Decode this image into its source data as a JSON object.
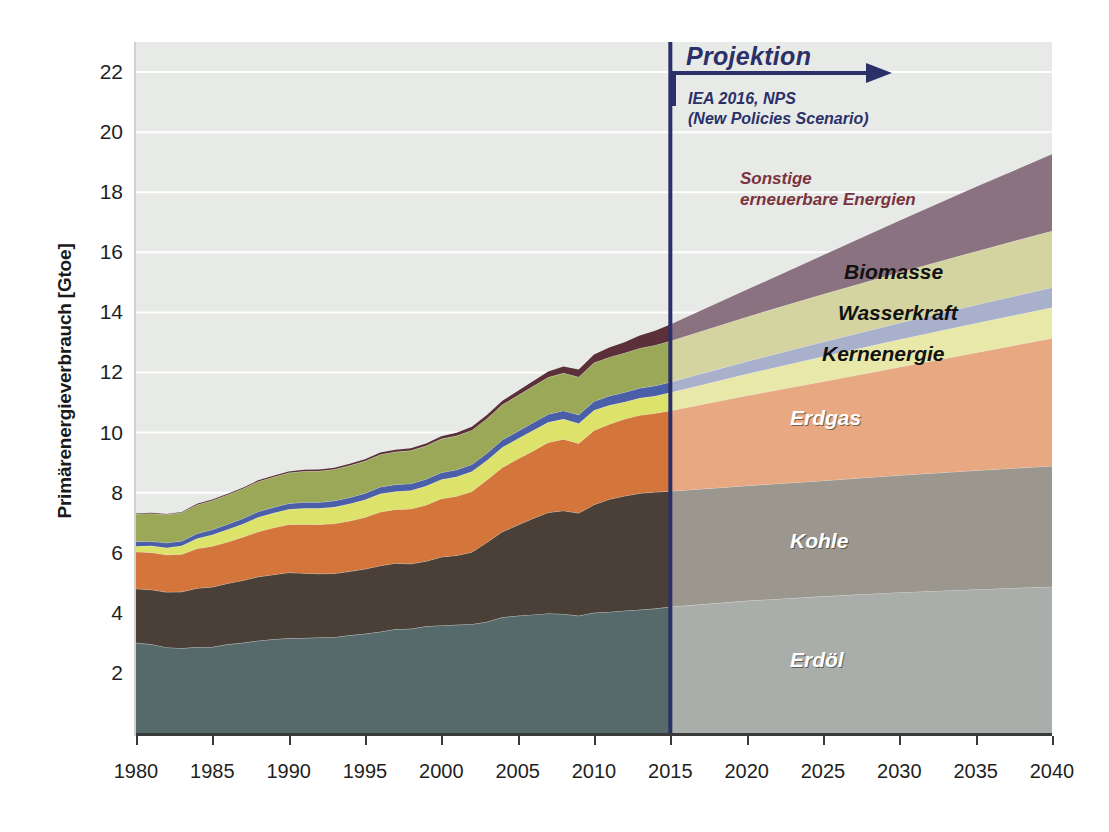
{
  "chart_data": {
    "type": "area",
    "title": "",
    "xlabel": "",
    "ylabel": "Primärenergieverbrauch [Gtoe]",
    "xlim": [
      1980,
      2040
    ],
    "ylim": [
      0,
      23
    ],
    "grid": true,
    "stacked": true,
    "legend_position": "in-plot-labels",
    "projection_start": 2015,
    "xticks": [
      "1980",
      "1985",
      "1990",
      "1995",
      "2000",
      "2005",
      "2010",
      "2015",
      "2020",
      "2025",
      "2030",
      "2035",
      "2040"
    ],
    "yticks": [
      "2",
      "4",
      "6",
      "8",
      "10",
      "12",
      "14",
      "16",
      "18",
      "20",
      "22"
    ],
    "x": [
      1980,
      1981,
      1982,
      1983,
      1984,
      1985,
      1986,
      1987,
      1988,
      1989,
      1990,
      1991,
      1992,
      1993,
      1994,
      1995,
      1996,
      1997,
      1998,
      1999,
      2000,
      2001,
      2002,
      2003,
      2004,
      2005,
      2006,
      2007,
      2008,
      2009,
      2010,
      2011,
      2012,
      2013,
      2014,
      2015,
      2020,
      2025,
      2030,
      2035,
      2040
    ],
    "series": [
      {
        "name": "Erdöl",
        "color_hist": "#56696b",
        "color_proj": "#a9aeab",
        "values": [
          3.0,
          2.95,
          2.85,
          2.82,
          2.86,
          2.86,
          2.95,
          3.0,
          3.07,
          3.12,
          3.15,
          3.16,
          3.18,
          3.19,
          3.25,
          3.3,
          3.37,
          3.45,
          3.47,
          3.55,
          3.58,
          3.6,
          3.62,
          3.7,
          3.85,
          3.9,
          3.94,
          3.98,
          3.96,
          3.9,
          4.0,
          4.03,
          4.07,
          4.1,
          4.14,
          4.2,
          4.4,
          4.55,
          4.68,
          4.78,
          4.87
        ]
      },
      {
        "name": "Kohle",
        "color_hist": "#4a4038",
        "color_proj": "#9b978e",
        "values": [
          1.8,
          1.82,
          1.84,
          1.88,
          1.96,
          2.0,
          2.03,
          2.08,
          2.13,
          2.15,
          2.19,
          2.16,
          2.12,
          2.12,
          2.13,
          2.16,
          2.2,
          2.2,
          2.16,
          2.17,
          2.28,
          2.31,
          2.4,
          2.65,
          2.85,
          3.02,
          3.2,
          3.36,
          3.44,
          3.42,
          3.6,
          3.75,
          3.82,
          3.88,
          3.88,
          3.85,
          3.83,
          3.85,
          3.9,
          3.96,
          4.02
        ]
      },
      {
        "name": "Erdgas",
        "color_hist": "#d4763c",
        "color_proj": "#e8a882",
        "values": [
          1.23,
          1.24,
          1.24,
          1.25,
          1.32,
          1.36,
          1.38,
          1.44,
          1.5,
          1.56,
          1.6,
          1.63,
          1.64,
          1.66,
          1.68,
          1.72,
          1.79,
          1.79,
          1.83,
          1.87,
          1.94,
          1.97,
          2.02,
          2.08,
          2.14,
          2.2,
          2.25,
          2.33,
          2.38,
          2.32,
          2.47,
          2.5,
          2.56,
          2.6,
          2.62,
          2.68,
          3.0,
          3.3,
          3.6,
          3.92,
          4.25
        ]
      },
      {
        "name": "Kernenergie",
        "color_hist": "#dde26a",
        "color_proj": "#e8e8a8",
        "values": [
          0.19,
          0.22,
          0.24,
          0.28,
          0.33,
          0.38,
          0.41,
          0.44,
          0.48,
          0.49,
          0.51,
          0.53,
          0.54,
          0.55,
          0.57,
          0.58,
          0.6,
          0.6,
          0.61,
          0.63,
          0.64,
          0.65,
          0.66,
          0.65,
          0.67,
          0.67,
          0.68,
          0.67,
          0.67,
          0.66,
          0.67,
          0.63,
          0.57,
          0.57,
          0.58,
          0.6,
          0.72,
          0.83,
          0.92,
          0.98,
          1.02
        ]
      },
      {
        "name": "Wasserkraft",
        "color_hist": "#4a5fa8",
        "color_proj": "#a8b0cc",
        "values": [
          0.15,
          0.15,
          0.16,
          0.16,
          0.17,
          0.17,
          0.18,
          0.18,
          0.19,
          0.19,
          0.19,
          0.2,
          0.2,
          0.21,
          0.21,
          0.22,
          0.23,
          0.23,
          0.23,
          0.23,
          0.23,
          0.23,
          0.24,
          0.24,
          0.25,
          0.25,
          0.26,
          0.27,
          0.28,
          0.29,
          0.3,
          0.31,
          0.32,
          0.33,
          0.34,
          0.35,
          0.42,
          0.49,
          0.55,
          0.61,
          0.67
        ]
      },
      {
        "name": "Biomasse",
        "color_hist": "#9aa857",
        "color_proj": "#d4d4a0",
        "values": [
          0.92,
          0.93,
          0.94,
          0.95,
          0.96,
          0.97,
          0.98,
          0.99,
          1.0,
          1.01,
          1.02,
          1.03,
          1.04,
          1.05,
          1.06,
          1.07,
          1.08,
          1.09,
          1.1,
          1.11,
          1.12,
          1.13,
          1.14,
          1.15,
          1.17,
          1.19,
          1.21,
          1.23,
          1.25,
          1.26,
          1.28,
          1.29,
          1.31,
          1.33,
          1.35,
          1.37,
          1.48,
          1.58,
          1.68,
          1.78,
          1.88
        ]
      },
      {
        "name": "Sonstige erneuerbare Energien",
        "color_hist": "#5b3038",
        "color_proj": "#8b7280",
        "values": [
          0.02,
          0.02,
          0.02,
          0.02,
          0.03,
          0.03,
          0.03,
          0.03,
          0.04,
          0.04,
          0.04,
          0.05,
          0.05,
          0.05,
          0.06,
          0.06,
          0.07,
          0.07,
          0.08,
          0.08,
          0.09,
          0.1,
          0.11,
          0.12,
          0.13,
          0.15,
          0.17,
          0.19,
          0.22,
          0.25,
          0.28,
          0.32,
          0.36,
          0.42,
          0.48,
          0.55,
          0.9,
          1.3,
          1.72,
          2.14,
          2.55
        ]
      }
    ],
    "annotations": {
      "projection_title": "Projektion",
      "projection_source": "IEA 2016, NPS\n(New Policies Scenario)",
      "projection_color": "#2b3168"
    },
    "series_labels": [
      {
        "name": "sonstige-erneuerbare-energien",
        "text": "Sonstige\nerneuerbare Energien"
      },
      {
        "name": "biomasse",
        "text": "Biomasse"
      },
      {
        "name": "wasserkraft",
        "text": "Wasserkraft"
      },
      {
        "name": "kernenergie",
        "text": "Kernenergie"
      },
      {
        "name": "erdgas",
        "text": "Erdgas"
      },
      {
        "name": "kohle",
        "text": "Kohle"
      },
      {
        "name": "erdoel",
        "text": "Erdöl"
      }
    ]
  }
}
